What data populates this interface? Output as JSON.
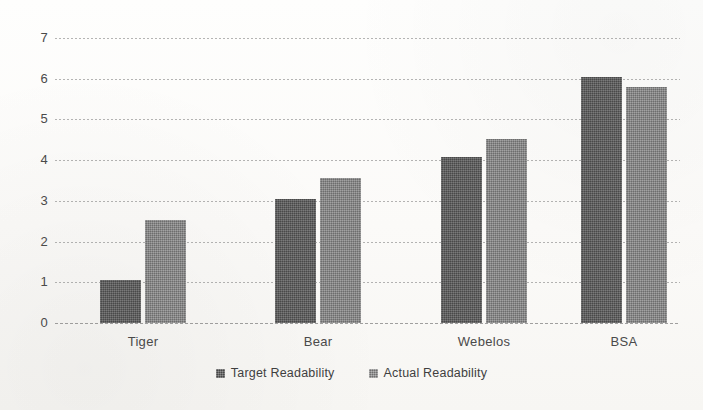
{
  "chart_data": {
    "type": "bar",
    "title": "",
    "xlabel": "",
    "ylabel": "",
    "categories": [
      "Tiger",
      "Bear",
      "Webelos",
      "BSA"
    ],
    "series": [
      {
        "name": "Target Readability",
        "color": "#5a5a5a",
        "values": [
          1.05,
          3.05,
          4.08,
          6.05
        ]
      },
      {
        "name": "Actual Readability",
        "color": "#848484",
        "values": [
          2.53,
          3.56,
          4.52,
          5.8
        ]
      }
    ],
    "ylim": [
      0,
      7
    ],
    "yticks": [
      0,
      1,
      2,
      3,
      4,
      5,
      6,
      7
    ],
    "ytick_labels": [
      "0",
      "1",
      "2",
      "3",
      "4",
      "5",
      "6",
      "7"
    ],
    "grid": true,
    "grid_axis": "y",
    "legend_position": "bottom",
    "background": "#fdfdfc"
  },
  "legend": {
    "items": [
      {
        "label": "Target Readability",
        "swatch": "target"
      },
      {
        "label": "Actual Readability",
        "swatch": "actual"
      }
    ]
  }
}
